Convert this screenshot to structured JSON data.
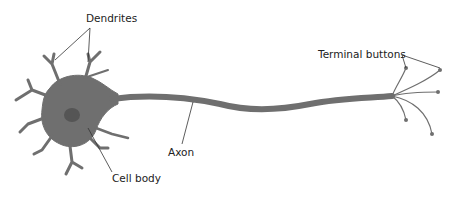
{
  "diagram": {
    "labels": {
      "dendrites": "Dendrites",
      "terminal_buttons": "Terminal buttons",
      "axon": "Axon",
      "cell_body": "Cell body"
    },
    "colors": {
      "cell_fill": "#6f6f6f",
      "nucleus": "#555555",
      "leader_line": "#333333",
      "text": "#222222",
      "background": "#ffffff"
    }
  }
}
